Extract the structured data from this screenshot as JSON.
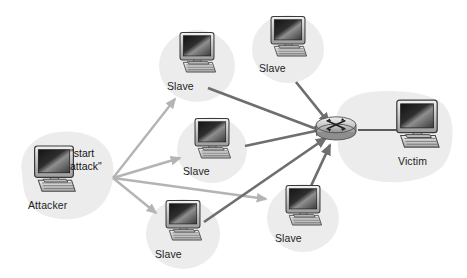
{
  "diagram": {
    "background_color": "#ffffff",
    "blob_color": "#ececec",
    "command_arrow_color": "#b4b4b4",
    "flood_arrow_color": "#6e6e6e",
    "link_color": "#2b2b2b"
  },
  "attacker": {
    "label": "Attacker",
    "command_text": "\"start\nattack\"",
    "icon": "desktop-computer-icon"
  },
  "victim": {
    "label": "Victim",
    "icon": "desktop-computer-icon",
    "router_icon": "router-icon"
  },
  "slaves": [
    {
      "label": "Slave",
      "icon": "desktop-computer-icon"
    },
    {
      "label": "Slave",
      "icon": "desktop-computer-icon"
    },
    {
      "label": "Slave",
      "icon": "desktop-computer-icon"
    },
    {
      "label": "Slave",
      "icon": "desktop-computer-icon"
    },
    {
      "label": "Slave",
      "icon": "desktop-computer-icon"
    }
  ]
}
